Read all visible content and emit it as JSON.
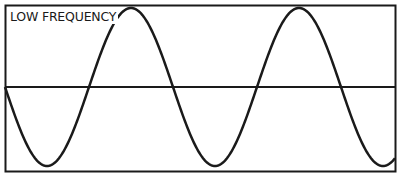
{
  "diagram": {
    "label": "LOW FREQUENCY",
    "stroke_color": "#1a1a1a",
    "wave": {
      "type": "sine",
      "start_phase": "descending at midline",
      "cycles_visible": 2.3,
      "period_px": 168,
      "amplitude_px": 79
    }
  }
}
